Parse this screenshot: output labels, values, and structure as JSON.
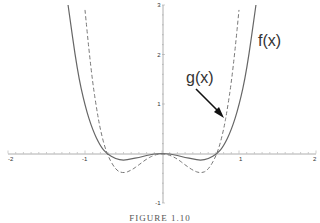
{
  "chart_data": {
    "type": "line",
    "title": "",
    "xlabel": "",
    "ylabel": "",
    "xlim": [
      -2,
      2
    ],
    "ylim": [
      -1,
      3
    ],
    "x_ticks": [
      "-2",
      "-1",
      "1",
      "2"
    ],
    "y_ticks": [
      "-1",
      "1",
      "2",
      "3"
    ],
    "series": [
      {
        "name": "f(x)",
        "style": "solid",
        "color": "#555555",
        "x": [
          -1.22,
          -1.1,
          -1.0,
          -0.9,
          -0.8,
          -0.72,
          -0.6,
          -0.5,
          -0.4,
          -0.3,
          -0.2,
          -0.1,
          0,
          0.1,
          0.2,
          0.3,
          0.4,
          0.5,
          0.6,
          0.72,
          0.8,
          0.9,
          1.0,
          1.1,
          1.22
        ],
        "y": [
          3.0,
          1.67,
          0.96,
          0.47,
          0.15,
          0.0,
          -0.11,
          -0.14,
          -0.11,
          -0.08,
          -0.04,
          -0.01,
          0,
          -0.01,
          -0.04,
          -0.08,
          -0.11,
          -0.14,
          -0.11,
          0.0,
          0.15,
          0.47,
          0.96,
          1.67,
          3.0
        ]
      },
      {
        "name": "g(x)",
        "style": "dashed",
        "color": "#666666",
        "x": [
          -1.0,
          -0.95,
          -0.9,
          -0.85,
          -0.8,
          -0.72,
          -0.6,
          -0.5,
          -0.4,
          -0.3,
          -0.2,
          -0.1,
          0,
          0.1,
          0.2,
          0.3,
          0.4,
          0.5,
          0.6,
          0.72,
          0.8,
          0.85,
          0.9,
          0.95,
          1.0
        ],
        "y": [
          2.9,
          2.11,
          1.43,
          0.91,
          0.47,
          0.0,
          -0.34,
          -0.4,
          -0.34,
          -0.23,
          -0.11,
          -0.03,
          0,
          -0.03,
          -0.11,
          -0.23,
          -0.34,
          -0.4,
          -0.34,
          0.0,
          0.47,
          0.91,
          1.43,
          2.11,
          2.9
        ]
      }
    ],
    "annotations": [
      {
        "text": "f(x)",
        "target": "f(x)",
        "position": "upper-right"
      },
      {
        "text": "g(x)",
        "target": "g(x)",
        "position": "right, with arrow"
      }
    ],
    "legend": "none",
    "grid": false
  },
  "caption": "FIGURE 1.10"
}
